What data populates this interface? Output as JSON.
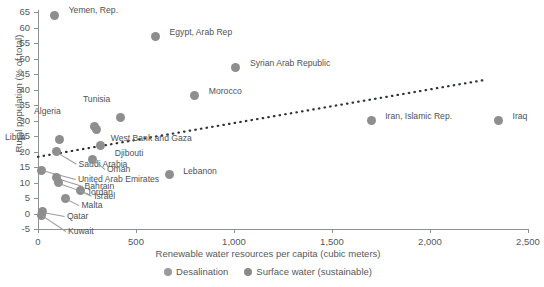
{
  "chart_data": {
    "type": "scatter",
    "title": "",
    "xlabel": "Renewable water resources per capita (cubic meters)",
    "ylabel": "Rural population (% of total)",
    "xlim": [
      0,
      2500
    ],
    "ylim": [
      -5,
      65
    ],
    "xticks": [
      "0",
      "500",
      "1,000",
      "1,500",
      "2,000",
      "2,500"
    ],
    "xtick_values": [
      0,
      500,
      1000,
      1500,
      2000,
      2500
    ],
    "yticks": [
      "-5",
      "0",
      "5",
      "10",
      "15",
      "20",
      "25",
      "30",
      "35",
      "40",
      "45",
      "50",
      "55",
      "60",
      "65"
    ],
    "ytick_values": [
      -5,
      0,
      5,
      10,
      15,
      20,
      25,
      30,
      35,
      40,
      45,
      50,
      55,
      60,
      65
    ],
    "grid": false,
    "legend_position": "bottom",
    "marker_color": "#8e8e8e",
    "points": [
      {
        "label": "Yemen, Rep.",
        "x": 85,
        "y": 64,
        "lx": 14,
        "ly": -5,
        "leader": false
      },
      {
        "label": "Egypt, Arab Rep",
        "x": 600,
        "y": 57,
        "lx": 14,
        "ly": -5,
        "leader": false
      },
      {
        "label": "Syrian Arab Republic",
        "x": 1010,
        "y": 47,
        "lx": 14,
        "ly": -5,
        "leader": false
      },
      {
        "label": "Morocco",
        "x": 800,
        "y": 38,
        "lx": 14,
        "ly": -5,
        "leader": false
      },
      {
        "label": "Tunisia",
        "x": 420,
        "y": 31,
        "lx": -14,
        "ly": -18,
        "leader": false
      },
      {
        "label": "Algeria",
        "x": 290,
        "y": 28,
        "lx": -38,
        "ly": -16,
        "leader": false
      },
      {
        "label": "West Bank and Gaza",
        "x": 300,
        "y": 27,
        "lx": 14,
        "ly": 8,
        "leader": false
      },
      {
        "label": "Libya",
        "x": 110,
        "y": 24,
        "lx": -38,
        "ly": -2,
        "leader": false
      },
      {
        "label": "Djibouti",
        "x": 320,
        "y": 22,
        "lx": 14,
        "ly": 8,
        "leader": false
      },
      {
        "label": "Saudi Arabia",
        "x": 95,
        "y": 20,
        "lx": 22,
        "ly": 12,
        "leader": true
      },
      {
        "label": "Oman",
        "x": 280,
        "y": 17.5,
        "lx": 14,
        "ly": 10,
        "leader": true
      },
      {
        "label": "United Arab Emirates",
        "x": 20,
        "y": 14,
        "lx": 36,
        "ly": 9,
        "leader": true
      },
      {
        "label": "Lebanon",
        "x": 670,
        "y": 12.5,
        "lx": 14,
        "ly": -4,
        "leader": false
      },
      {
        "label": "Bahrain",
        "x": 95,
        "y": 11.5,
        "lx": 28,
        "ly": 8,
        "leader": true
      },
      {
        "label": "Jordan",
        "x": 105,
        "y": 10,
        "lx": 28,
        "ly": 9,
        "leader": true
      },
      {
        "label": "Israel",
        "x": 215,
        "y": 7.5,
        "lx": 14,
        "ly": 6,
        "leader": true
      },
      {
        "label": "Malta",
        "x": 140,
        "y": 5,
        "lx": 16,
        "ly": 7,
        "leader": true
      },
      {
        "label": "Qatar",
        "x": 25,
        "y": 0.5,
        "lx": 24,
        "ly": 4,
        "leader": true
      },
      {
        "label": "Kuwait",
        "x": 20,
        "y": -0.5,
        "lx": 26,
        "ly": 16,
        "leader": true
      },
      {
        "label": "Iran, Islamic Rep.",
        "x": 1700,
        "y": 30,
        "lx": 14,
        "ly": -5,
        "leader": false
      },
      {
        "label": "Iraq",
        "x": 2350,
        "y": 30,
        "lx": 14,
        "ly": -5,
        "leader": false
      }
    ],
    "trendline": {
      "style": "dotted",
      "color": "#2f3336",
      "x0": 0,
      "y0": 18.3,
      "x1": 2290,
      "y1": 43.2
    },
    "legend": [
      {
        "name": "Desalination",
        "color": "#9a9a9a"
      },
      {
        "name": "Surface water (sustainable)",
        "color": "#8a8a8a"
      }
    ]
  }
}
